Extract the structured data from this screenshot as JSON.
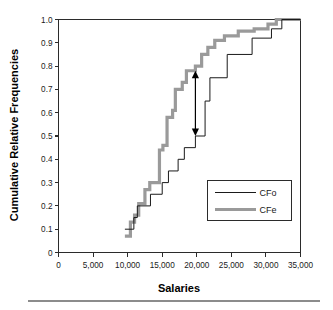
{
  "chart_data": {
    "type": "line",
    "subtype": "step-ecdf",
    "title": "",
    "xlabel": "Salaries",
    "ylabel": "Cumulative Relative Frequencies",
    "xlim": [
      0,
      35000
    ],
    "ylim": [
      0,
      1.0
    ],
    "grid": false,
    "legend_position": "lower-right",
    "xticks": [
      0,
      5000,
      10000,
      15000,
      20000,
      25000,
      30000,
      35000
    ],
    "xticklabels": [
      "0",
      "5,000",
      "10,000",
      "15,000",
      "20,000",
      "25,000",
      "30,000",
      "35,000"
    ],
    "yticks": [
      0,
      0.1,
      0.2,
      0.3,
      0.4,
      0.5,
      0.6,
      0.7,
      0.8,
      0.9,
      1.0
    ],
    "yticklabels": [
      "0",
      "0.1",
      "0.2",
      "0.3",
      "0.4",
      "0.5",
      "0.6",
      "0.7",
      "0.8",
      "0.9",
      "1.0"
    ],
    "series": [
      {
        "name": "CFo",
        "style": "thin-black",
        "color": "#1a1a1a",
        "linewidth": 1.0,
        "points": [
          [
            9600,
            0.1
          ],
          [
            10900,
            0.1
          ],
          [
            10900,
            0.15
          ],
          [
            11400,
            0.15
          ],
          [
            11400,
            0.2
          ],
          [
            13300,
            0.2
          ],
          [
            13300,
            0.25
          ],
          [
            15000,
            0.25
          ],
          [
            15000,
            0.3
          ],
          [
            15900,
            0.3
          ],
          [
            15900,
            0.35
          ],
          [
            17300,
            0.35
          ],
          [
            17300,
            0.4
          ],
          [
            18200,
            0.4
          ],
          [
            18200,
            0.45
          ],
          [
            19800,
            0.45
          ],
          [
            19800,
            0.5
          ],
          [
            21200,
            0.5
          ],
          [
            21200,
            0.65
          ],
          [
            21900,
            0.65
          ],
          [
            21900,
            0.75
          ],
          [
            24400,
            0.75
          ],
          [
            24400,
            0.85
          ],
          [
            28000,
            0.85
          ],
          [
            28000,
            0.92
          ],
          [
            30800,
            0.92
          ],
          [
            30800,
            0.96
          ],
          [
            32300,
            0.96
          ],
          [
            32300,
            1.0
          ],
          [
            35000,
            1.0
          ]
        ]
      },
      {
        "name": "CFe",
        "style": "thick-gray",
        "color": "#9a9a9a",
        "linewidth": 3.2,
        "points": [
          [
            9600,
            0.07
          ],
          [
            10400,
            0.07
          ],
          [
            10400,
            0.13
          ],
          [
            11000,
            0.13
          ],
          [
            11000,
            0.16
          ],
          [
            11600,
            0.16
          ],
          [
            11600,
            0.21
          ],
          [
            12500,
            0.21
          ],
          [
            12500,
            0.27
          ],
          [
            13200,
            0.27
          ],
          [
            13200,
            0.3
          ],
          [
            14600,
            0.3
          ],
          [
            14600,
            0.44
          ],
          [
            15100,
            0.44
          ],
          [
            15100,
            0.46
          ],
          [
            15700,
            0.46
          ],
          [
            15700,
            0.58
          ],
          [
            16500,
            0.58
          ],
          [
            16500,
            0.61
          ],
          [
            16900,
            0.61
          ],
          [
            16900,
            0.7
          ],
          [
            17900,
            0.7
          ],
          [
            17900,
            0.73
          ],
          [
            18500,
            0.73
          ],
          [
            18500,
            0.78
          ],
          [
            19800,
            0.78
          ],
          [
            19800,
            0.8
          ],
          [
            20700,
            0.8
          ],
          [
            20700,
            0.85
          ],
          [
            21600,
            0.85
          ],
          [
            21600,
            0.88
          ],
          [
            22600,
            0.88
          ],
          [
            22600,
            0.91
          ],
          [
            24000,
            0.91
          ],
          [
            24000,
            0.93
          ],
          [
            26000,
            0.93
          ],
          [
            26000,
            0.95
          ],
          [
            28300,
            0.95
          ],
          [
            28300,
            0.96
          ],
          [
            30300,
            0.96
          ],
          [
            30300,
            0.98
          ],
          [
            31500,
            0.98
          ],
          [
            31500,
            1.0
          ],
          [
            35000,
            1.0
          ]
        ]
      }
    ],
    "annotations": [
      {
        "name": "max-deviation-arrow",
        "type": "double-headed-arrow",
        "x": 19800,
        "y_top": 0.78,
        "y_bottom": 0.5,
        "label": ""
      }
    ],
    "legend": {
      "entries": [
        {
          "label": "CFo",
          "style": "thin-black"
        },
        {
          "label": "CFe",
          "style": "thick-gray"
        }
      ]
    }
  },
  "colors": {
    "axis": "#2b2b2b",
    "text": "#1a1a1a",
    "cfo": "#1a1a1a",
    "cfe": "#9a9a9a",
    "footer_rule": "#8c8c8c",
    "background": "#ffffff"
  }
}
